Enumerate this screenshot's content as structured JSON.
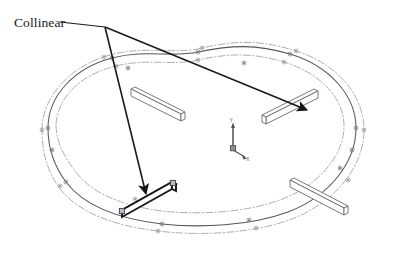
{
  "canvas": {
    "width": 403,
    "height": 253,
    "background": "#ffffff"
  },
  "annotation": {
    "label": "Collinear",
    "label_position": {
      "x": 14,
      "y": 27
    },
    "leader": {
      "name": "leader-line",
      "from": {
        "x": 60,
        "y": 22
      },
      "vertex": {
        "x": 105,
        "y": 27
      },
      "color": "#1a1a1a"
    },
    "arrows": [
      {
        "name": "arrow-to-upper-right-rib",
        "from": {
          "x": 105,
          "y": 27
        },
        "to": {
          "x": 307,
          "y": 110
        },
        "target": "rib-upper-right",
        "color": "#1a1a1a"
      },
      {
        "name": "arrow-to-lower-left-rib",
        "from": {
          "x": 105,
          "y": 27
        },
        "to": {
          "x": 146,
          "y": 194
        },
        "target": "rib-lower-left",
        "color": "#1a1a1a"
      }
    ]
  },
  "geometry": {
    "profile_curve_color": "#55585c",
    "guide_curve_color": "#9aa0a6",
    "rib_outline_color": "#6e7276",
    "rib_fill": "#ffffff",
    "highlight_color": "#15161a",
    "marker_color": "#7b8086",
    "handle_fill": "#b9bdc2",
    "handle_stroke": "#3c3f44",
    "outer_profile_path": "M 48 128 C 48 96 74 68 112 58 C 146 49 170 58 198 52 C 232 45 256 44 290 54 C 330 66 356 96 356 128 C 356 162 330 196 288 212 C 250 226 200 228 162 224 C 120 219 84 206 66 182 C 54 166 48 147 48 128 Z",
    "guide_curves": [
      {
        "name": "guide-curve-outer",
        "path": "M 42 130 C 42 97 70 66 110 55 C 146 45 174 55 202 48 C 236 40 262 40 296 51 C 338 64 364 96 364 130 C 364 166 336 202 292 219 C 252 234 198 236 158 231 C 114 226 76 212 58 186 C 46 168 42 150 42 130 Z"
      },
      {
        "name": "guide-curve-inner",
        "path": "M 56 124 C 58 96 82 74 116 66 C 148 58 172 66 198 60 C 230 53 254 53 284 62 C 320 73 344 98 344 126 C 344 156 318 186 280 200 C 244 213 198 215 162 211 C 124 206 92 194 76 172 C 62 154 56 140 56 124 Z"
      }
    ],
    "curve_markers": [
      {
        "x": 112,
        "y": 58
      },
      {
        "x": 198,
        "y": 52
      },
      {
        "x": 290,
        "y": 54
      },
      {
        "x": 48,
        "y": 128
      },
      {
        "x": 356,
        "y": 128
      },
      {
        "x": 162,
        "y": 224
      },
      {
        "x": 249,
        "y": 220
      },
      {
        "x": 66,
        "y": 182
      },
      {
        "x": 340,
        "y": 168
      },
      {
        "x": 52,
        "y": 150
      },
      {
        "x": 352,
        "y": 150
      },
      {
        "x": 128,
        "y": 68
      },
      {
        "x": 244,
        "y": 63
      }
    ],
    "guide_markers": [
      {
        "x": 104,
        "y": 57
      },
      {
        "x": 202,
        "y": 48
      },
      {
        "x": 296,
        "y": 51
      },
      {
        "x": 42,
        "y": 130
      },
      {
        "x": 364,
        "y": 130
      },
      {
        "x": 158,
        "y": 231
      },
      {
        "x": 256,
        "y": 228
      },
      {
        "x": 60,
        "y": 186
      },
      {
        "x": 348,
        "y": 180
      },
      {
        "x": 116,
        "y": 66
      },
      {
        "x": 284,
        "y": 62
      },
      {
        "x": 198,
        "y": 60
      },
      {
        "x": 135,
        "y": 199
      }
    ]
  },
  "ribs": [
    {
      "name": "rib-upper-left",
      "id": "rib_upper_left",
      "highlighted": false,
      "top_face": "M 131 89 L 181 114 L 185 112 L 135 87 Z",
      "front_face": "M 131 89 L 181 114 L 181 121 L 131 96 Z",
      "side_face": "M 181 114 L 185 112 L 185 119 L 181 121 Z"
    },
    {
      "name": "rib-upper-right",
      "id": "rib_upper_right",
      "highlighted": false,
      "top_face": "M 318 91 L 266 117 L 262 115 L 314 89 Z",
      "front_face": "M 318 91 L 318 98 L 266 124 L 266 117 Z",
      "side_face": "M 266 117 L 266 124 L 262 122 L 262 115 Z"
    },
    {
      "name": "rib-lower-right",
      "id": "rib_lower_right",
      "highlighted": false,
      "top_face": "M 290 180 L 344 208 L 348 206 L 294 178 Z",
      "front_face": "M 290 180 L 290 187 L 344 215 L 344 208 Z",
      "side_face": "M 344 208 L 348 206 L 348 213 L 344 215 Z"
    },
    {
      "name": "rib-lower-left",
      "id": "rib_lower_left",
      "highlighted": true,
      "top_face": "M 122 210 L 172 182 L 176 184 L 126 212 Z",
      "front_face": "M 122 210 L 122 217 L 172 189 L 172 182 Z",
      "side_face": "M 172 182 L 176 184 L 176 191 L 172 189 Z",
      "handles": [
        {
          "name": "rib-handle-start",
          "x": 122,
          "y": 211
        },
        {
          "name": "rib-handle-end",
          "x": 173,
          "y": 183
        }
      ]
    }
  ],
  "axis_triad": {
    "name": "coordinate-triad",
    "origin": {
      "x": 233,
      "y": 150
    },
    "y_axis_end": {
      "x": 233,
      "y": 126
    },
    "x_axis_end": {
      "x": 245,
      "y": 157
    },
    "color": "#4d5156",
    "y_label": "Y",
    "x_label": "X"
  }
}
